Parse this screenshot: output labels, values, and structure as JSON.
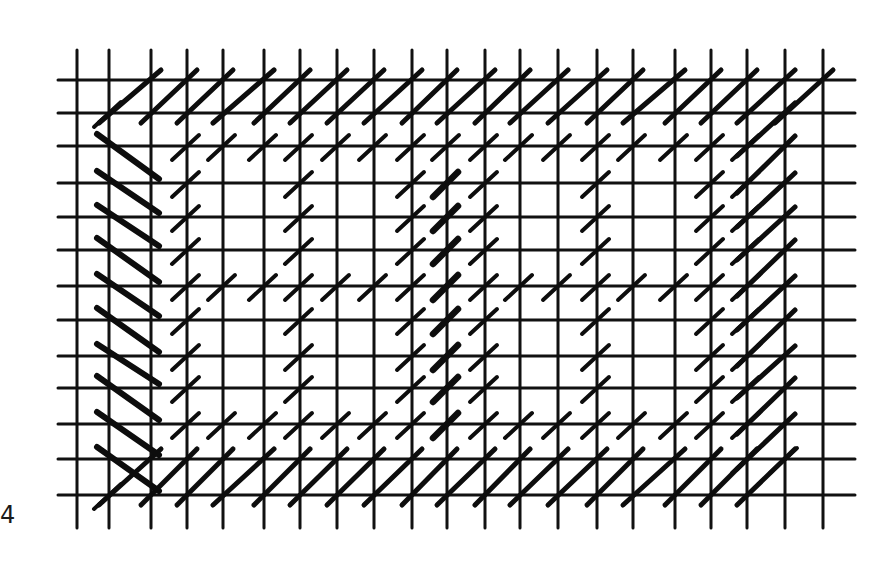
{
  "figure": {
    "label": "4",
    "colors": {
      "background": "#ffffff",
      "ink": "#111111"
    }
  },
  "grid": {
    "x": [
      77,
      109,
      151,
      187,
      223,
      264,
      300,
      337,
      374,
      412,
      447,
      485,
      520,
      558,
      597,
      633,
      675,
      711,
      747,
      785,
      823
    ],
    "y": [
      80,
      113,
      146,
      183,
      217,
      250,
      286,
      320,
      356,
      388,
      424,
      459,
      495
    ],
    "h_line_extent": [
      58,
      855
    ],
    "v_line_extent": [
      50,
      528
    ]
  },
  "stitches": {
    "long_slash_top_row0": {
      "row": 0,
      "cols": [
        1,
        2,
        3,
        4,
        5,
        6,
        7,
        8,
        9,
        10,
        11,
        12,
        13,
        14,
        15,
        16,
        17,
        18,
        19
      ],
      "width": 5
    },
    "long_slash_bottom_row12": {
      "row": 11,
      "cols": [
        2,
        3,
        4,
        5,
        6,
        7,
        8,
        9,
        10,
        11,
        12,
        13,
        14,
        15,
        16,
        17,
        18,
        19
      ],
      "width": 5
    },
    "long_slash_right": {
      "col": 19,
      "rows": [
        1,
        2,
        3,
        4,
        5,
        6,
        7,
        8,
        9,
        10
      ],
      "width": 5
    },
    "long_backslash_left": {
      "col": 1,
      "rows": [
        2,
        3,
        4,
        5,
        6,
        7,
        8,
        9,
        10,
        11
      ],
      "width": 6
    },
    "short_slash": [
      [
        1,
        12
      ],
      [
        1,
        1
      ],
      [
        3,
        2
      ],
      [
        4,
        2
      ],
      [
        5,
        2
      ],
      [
        6,
        2
      ],
      [
        7,
        2
      ],
      [
        8,
        2
      ],
      [
        9,
        2
      ],
      [
        10,
        2
      ],
      [
        11,
        2
      ],
      [
        12,
        2
      ],
      [
        13,
        2
      ],
      [
        14,
        2
      ],
      [
        15,
        2
      ],
      [
        16,
        2
      ],
      [
        17,
        2
      ],
      [
        18,
        2
      ],
      [
        3,
        3
      ],
      [
        3,
        4
      ],
      [
        3,
        5
      ],
      [
        3,
        6
      ],
      [
        3,
        7
      ],
      [
        3,
        8
      ],
      [
        3,
        9
      ],
      [
        3,
        10
      ],
      [
        4,
        6
      ],
      [
        5,
        6
      ],
      [
        6,
        6
      ],
      [
        7,
        6
      ],
      [
        8,
        6
      ],
      [
        9,
        6
      ],
      [
        11,
        6
      ],
      [
        12,
        6
      ],
      [
        13,
        6
      ],
      [
        14,
        6
      ],
      [
        15,
        6
      ],
      [
        16,
        6
      ],
      [
        17,
        6
      ],
      [
        4,
        10
      ],
      [
        5,
        10
      ],
      [
        6,
        10
      ],
      [
        7,
        10
      ],
      [
        8,
        10
      ],
      [
        9,
        10
      ],
      [
        11,
        10
      ],
      [
        12,
        10
      ],
      [
        13,
        10
      ],
      [
        14,
        10
      ],
      [
        15,
        10
      ],
      [
        16,
        10
      ],
      [
        17,
        10
      ],
      [
        6,
        3
      ],
      [
        6,
        4
      ],
      [
        6,
        5
      ],
      [
        6,
        7
      ],
      [
        6,
        8
      ],
      [
        6,
        9
      ],
      [
        9,
        3
      ],
      [
        9,
        4
      ],
      [
        9,
        5
      ],
      [
        9,
        7
      ],
      [
        9,
        8
      ],
      [
        9,
        9
      ],
      [
        11,
        3
      ],
      [
        11,
        4
      ],
      [
        11,
        5
      ],
      [
        11,
        7
      ],
      [
        11,
        8
      ],
      [
        11,
        9
      ],
      [
        14,
        3
      ],
      [
        14,
        4
      ],
      [
        14,
        5
      ],
      [
        14,
        7
      ],
      [
        14,
        8
      ],
      [
        14,
        9
      ],
      [
        17,
        3
      ],
      [
        17,
        4
      ],
      [
        17,
        5
      ],
      [
        17,
        7
      ],
      [
        17,
        8
      ],
      [
        17,
        9
      ],
      [
        18,
        3
      ],
      [
        18,
        4
      ],
      [
        18,
        5
      ],
      [
        18,
        6
      ],
      [
        18,
        7
      ],
      [
        18,
        8
      ],
      [
        18,
        9
      ],
      [
        18,
        10
      ],
      [
        18,
        11
      ],
      [
        19,
        11
      ]
    ],
    "thick_slash": [
      [
        10,
        3
      ],
      [
        10,
        4
      ],
      [
        10,
        5
      ],
      [
        10,
        6
      ],
      [
        10,
        7
      ],
      [
        10,
        8
      ],
      [
        10,
        9
      ],
      [
        10,
        10
      ]
    ]
  }
}
